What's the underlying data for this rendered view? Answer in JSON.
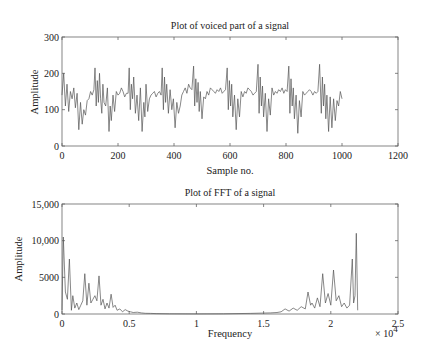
{
  "chart_data": [
    {
      "type": "line",
      "title": "Plot of voiced part of a signal",
      "xlabel": "Sample no.",
      "ylabel": "Amplitude",
      "xlim": [
        0,
        1200
      ],
      "ylim": [
        0,
        300
      ],
      "xticks": [
        0,
        200,
        400,
        600,
        800,
        1000,
        1200
      ],
      "xtick_labels": [
        "0",
        "200",
        "400",
        "600",
        "800",
        "1000",
        "1200"
      ],
      "yticks": [
        0,
        100,
        200,
        300
      ],
      "ytick_labels": [
        "0",
        "100",
        "200",
        "300"
      ],
      "grid": false,
      "series": [
        {
          "name": "voiced signal",
          "color": "#555555",
          "x": [
            0,
            6,
            12,
            18,
            24,
            30,
            36,
            42,
            48,
            54,
            60,
            66,
            72,
            78,
            84,
            90,
            96,
            102,
            108,
            114,
            118,
            122,
            126,
            130,
            134,
            138,
            142,
            146,
            150,
            156,
            162,
            168,
            172,
            176,
            182,
            188,
            194,
            200,
            206,
            212,
            218,
            224,
            230,
            236,
            240,
            244,
            248,
            252,
            256,
            262,
            268,
            274,
            280,
            286,
            292,
            296,
            300,
            306,
            312,
            318,
            324,
            330,
            336,
            342,
            348,
            354,
            358,
            362,
            366,
            370,
            374,
            380,
            386,
            392,
            398,
            404,
            410,
            416,
            422,
            428,
            434,
            440,
            446,
            452,
            458,
            464,
            470,
            474,
            478,
            482,
            486,
            490,
            494,
            500,
            506,
            512,
            518,
            524,
            530,
            536,
            542,
            548,
            554,
            560,
            566,
            572,
            578,
            584,
            590,
            594,
            598,
            602,
            606,
            610,
            616,
            622,
            628,
            634,
            640,
            646,
            652,
            658,
            664,
            670,
            676,
            682,
            688,
            694,
            700,
            704,
            708,
            712,
            716,
            720,
            726,
            732,
            738,
            744,
            750,
            756,
            762,
            768,
            774,
            780,
            786,
            792,
            798,
            804,
            810,
            814,
            818,
            822,
            826,
            830,
            836,
            842,
            848,
            854,
            860,
            866,
            872,
            878,
            884,
            890,
            896,
            902,
            908,
            914,
            920,
            926,
            930,
            934,
            938,
            942,
            946,
            952,
            958,
            964,
            970,
            976,
            982,
            988,
            994,
            1000,
            1006,
            1012,
            1018,
            1024
          ],
          "y": [
            140,
            200,
            110,
            170,
            95,
            150,
            130,
            160,
            105,
            145,
            45,
            120,
            60,
            100,
            85,
            125,
            130,
            150,
            140,
            155,
            215,
            110,
            180,
            120,
            200,
            130,
            90,
            170,
            120,
            110,
            160,
            40,
            110,
            70,
            140,
            95,
            150,
            140,
            145,
            160,
            150,
            135,
            145,
            145,
            215,
            100,
            170,
            130,
            190,
            90,
            140,
            70,
            160,
            40,
            120,
            80,
            170,
            95,
            130,
            140,
            145,
            150,
            135,
            145,
            150,
            140,
            215,
            100,
            190,
            120,
            170,
            90,
            155,
            100,
            130,
            50,
            120,
            90,
            110,
            140,
            150,
            160,
            145,
            170,
            160,
            155,
            220,
            110,
            185,
            120,
            175,
            95,
            150,
            75,
            135,
            130,
            150,
            140,
            160,
            155,
            150,
            145,
            155,
            150,
            160,
            145,
            150,
            155,
            215,
            100,
            180,
            110,
            170,
            80,
            140,
            45,
            130,
            80,
            150,
            135,
            150,
            145,
            160,
            155,
            150,
            140,
            145,
            150,
            225,
            90,
            190,
            110,
            165,
            80,
            145,
            40,
            130,
            85,
            160,
            140,
            150,
            145,
            155,
            150,
            160,
            145,
            155,
            150,
            220,
            90,
            185,
            110,
            160,
            75,
            140,
            35,
            125,
            80,
            150,
            140,
            145,
            150,
            155,
            150,
            140,
            150,
            145,
            150,
            225,
            90,
            190,
            110,
            170,
            75,
            140,
            40,
            135,
            50,
            130,
            70,
            125,
            110,
            150,
            130
          ]
        }
      ]
    },
    {
      "type": "line",
      "title": "Plot of FFT of a signal",
      "xlabel": "Frequency",
      "ylabel": "Amplitude",
      "xlim": [
        0,
        25000
      ],
      "ylim": [
        0,
        15000
      ],
      "xticks": [
        0,
        5000,
        10000,
        15000,
        20000,
        25000
      ],
      "xtick_labels": [
        "0",
        "0.5",
        "1",
        "1.5",
        "2",
        "2.5"
      ],
      "x_multiplier": "× 10^4",
      "yticks": [
        0,
        5000,
        10000,
        15000
      ],
      "ytick_labels": [
        "0",
        "5000",
        "10,000",
        "15,000"
      ],
      "grid": false,
      "series": [
        {
          "name": "FFT magnitude",
          "color": "#555555",
          "x": [
            0,
            100,
            250,
            400,
            550,
            700,
            800,
            950,
            1100,
            1250,
            1400,
            1550,
            1700,
            1850,
            2000,
            2150,
            2300,
            2450,
            2600,
            2750,
            2900,
            3050,
            3200,
            3350,
            3500,
            3650,
            3800,
            3950,
            4100,
            4300,
            4500,
            4700,
            4900,
            5100,
            5300,
            5600,
            5900,
            6200,
            6600,
            7000,
            8000,
            10000,
            12000,
            14000,
            15500,
            16000,
            16300,
            16600,
            16900,
            17200,
            17500,
            17800,
            18100,
            18300,
            18500,
            18600,
            18800,
            19000,
            19200,
            19400,
            19600,
            19800,
            20000,
            20200,
            20400,
            20600,
            20800,
            21000,
            21200,
            21400,
            21600,
            21700,
            21800,
            21900,
            22000
          ],
          "y": [
            500,
            10500,
            3000,
            2000,
            7500,
            500,
            2500,
            800,
            1500,
            600,
            1200,
            1800,
            5500,
            1200,
            4200,
            1500,
            2000,
            2500,
            1800,
            5200,
            1200,
            2000,
            700,
            1500,
            800,
            2700,
            900,
            1200,
            500,
            700,
            300,
            600,
            400,
            300,
            200,
            250,
            150,
            100,
            80,
            50,
            30,
            20,
            30,
            80,
            150,
            200,
            300,
            700,
            400,
            800,
            500,
            1000,
            700,
            3000,
            1200,
            1500,
            800,
            2200,
            1000,
            5500,
            1500,
            2800,
            1200,
            6000,
            1800,
            2500,
            1000,
            1500,
            800,
            1200,
            7500,
            1500,
            2500,
            11000,
            500
          ]
        }
      ]
    }
  ],
  "plots": {
    "top": {
      "title": "Plot of voiced part of a signal",
      "xlabel": "Sample no.",
      "ylabel": "Amplitude"
    },
    "bottom": {
      "title": "Plot of FFT of a signal",
      "xlabel": "Frequency",
      "ylabel": "Amplitude",
      "multiplier_base": "× 10",
      "multiplier_exp": "4"
    }
  },
  "style": {
    "line_color": "#555555",
    "axis_color": "#666666",
    "text_color": "#222222"
  }
}
